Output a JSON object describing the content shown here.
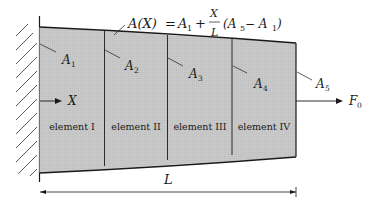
{
  "diagram": {
    "title_formula": {
      "lhs": "A(X)",
      "eq": "=",
      "a1": "A",
      "a1_sub": "1",
      "plus": "+",
      "frac_num": "X",
      "frac_den": "L",
      "paren_open": "(A",
      "a5_sub": "5",
      "minus": " − A",
      "a1b_sub": "1",
      "paren_close": ")"
    },
    "area_labels": [
      {
        "base": "A",
        "sub": "1"
      },
      {
        "base": "A",
        "sub": "2"
      },
      {
        "base": "A",
        "sub": "3"
      },
      {
        "base": "A",
        "sub": "4"
      },
      {
        "base": "A",
        "sub": "5"
      }
    ],
    "elements": [
      "element I",
      "element II",
      "element III",
      "element IV"
    ],
    "axis_label": "X",
    "force": {
      "base": "F",
      "sub": "0"
    },
    "length_label": "L",
    "colors": {
      "fill": "#c8c8c8",
      "stroke": "#1a1a1a",
      "background": "#ffffff"
    }
  }
}
